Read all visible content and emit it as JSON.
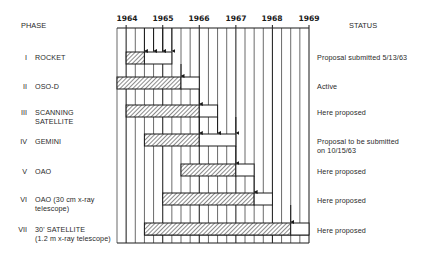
{
  "chart_data": {
    "type": "gantt",
    "title": "",
    "column_headers": {
      "left": "PHASE",
      "right": "STATUS"
    },
    "x_axis": {
      "ticks": [
        "1964",
        "1965",
        "1966",
        "1967",
        "1968",
        "1969"
      ],
      "range": [
        1963.75,
        1969.0
      ],
      "minor_interval": "quarter",
      "grid": true
    },
    "legend_hint": {
      "hatched": "planned/ongoing phase",
      "open": "follow-on / extension",
      "arrow": "milestone"
    },
    "rows": [
      {
        "roman": "I",
        "name": "ROCKET",
        "status": "Proposal submitted 5/13/63",
        "hatched": [
          1964.0,
          1964.5
        ],
        "open": [
          1964.5,
          1965.25
        ],
        "milestones": [
          1964.5,
          1964.75,
          1965.0,
          1965.25
        ]
      },
      {
        "roman": "II",
        "name": "OSO-D",
        "status": "Active",
        "hatched": [
          1963.75,
          1965.5
        ],
        "open": [
          1965.5,
          1966.0
        ],
        "milestones": [
          1965.5
        ]
      },
      {
        "roman": "III",
        "name": "SCANNING SATELLITE",
        "status": "Here proposed",
        "hatched": [
          1964.0,
          1966.0
        ],
        "open": [
          1966.0,
          1966.5
        ],
        "milestones": [
          1966.0
        ]
      },
      {
        "roman": "IV",
        "name": "GEMINI",
        "status": "Proposal to be submitted on 10/15/63",
        "hatched": [
          1964.5,
          1966.0
        ],
        "open": [
          1966.0,
          1967.0
        ],
        "milestones": [
          1966.0,
          1966.5,
          1967.0
        ]
      },
      {
        "roman": "V",
        "name": "OAO",
        "status": "Here proposed",
        "hatched": [
          1965.5,
          1967.0
        ],
        "open": [
          1967.0,
          1967.5
        ],
        "milestones": [
          1967.0
        ]
      },
      {
        "roman": "VI",
        "name": "OAO (30 cm x-ray telescope)",
        "status": "Here proposed",
        "hatched": [
          1965.0,
          1967.5
        ],
        "open": [
          1967.5,
          1968.0
        ],
        "milestones": [
          1967.5
        ]
      },
      {
        "roman": "VII",
        "name": "30' SATELLITE (1.2 m x-ray telescope)",
        "status": "Here proposed",
        "hatched": [
          1964.5,
          1968.5
        ],
        "open": [
          1968.5,
          1969.0
        ],
        "milestones": [
          1968.5
        ]
      }
    ]
  },
  "header": {
    "phase": "PHASE",
    "status": "STATUS"
  },
  "years": [
    "1964",
    "1965",
    "1966",
    "1967",
    "1968",
    "1969"
  ],
  "rows": [
    {
      "roman": "I",
      "name1": "ROCKET",
      "name2": "",
      "status1": "Proposal submitted 5/13/63",
      "status2": ""
    },
    {
      "roman": "II",
      "name1": "OSO-D",
      "name2": "",
      "status1": "Active",
      "status2": ""
    },
    {
      "roman": "III",
      "name1": "SCANNING",
      "name2": "SATELLITE",
      "status1": "Here proposed",
      "status2": ""
    },
    {
      "roman": "IV",
      "name1": "GEMINI",
      "name2": "",
      "status1": "Proposal to be submitted",
      "status2": "on 10/15/63"
    },
    {
      "roman": "V",
      "name1": "OAO",
      "name2": "",
      "status1": "Here proposed",
      "status2": ""
    },
    {
      "roman": "VI",
      "name1": "OAO (30 cm x-ray",
      "name2": "telescope)",
      "status1": "Here proposed",
      "status2": ""
    },
    {
      "roman": "VII",
      "name1": "30' SATELLITE",
      "name2": "(1.2 m x-ray telescope)",
      "status1": "Here proposed",
      "status2": ""
    }
  ]
}
